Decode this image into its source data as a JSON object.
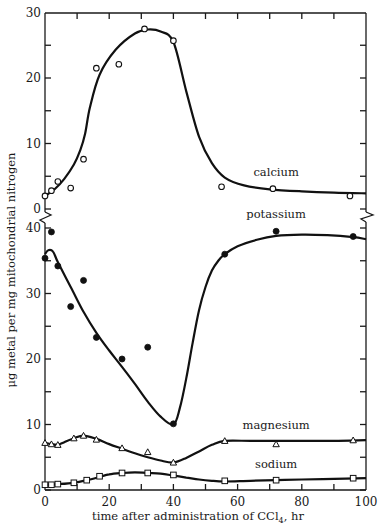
{
  "chart_data": {
    "type": "scatter",
    "title": "",
    "xlabel": "time after administration of CCl4, hr",
    "xlabel_parts": {
      "main": "time after administration of CCl",
      "subscript": "4",
      "tail": ", hr"
    },
    "ylabel": "μg metal per mg mitochondrial nitrogen",
    "xlim": [
      0,
      100
    ],
    "xticks": [
      0,
      20,
      40,
      60,
      80,
      100
    ],
    "x_minor_ticks": [
      10,
      30,
      50,
      70,
      90
    ],
    "grid": false,
    "legend": "inline labels next to curves",
    "panels": [
      {
        "name": "upper",
        "ylim": [
          0,
          30
        ],
        "yticks": [
          0,
          10,
          20,
          30
        ],
        "y_minor_ticks": [
          5,
          15,
          25
        ],
        "axis_break_below": true
      },
      {
        "name": "lower",
        "ylim": [
          0,
          42
        ],
        "yticks": [
          0,
          10,
          20,
          30,
          40
        ],
        "y_minor_ticks": [
          5,
          15,
          25,
          35
        ],
        "axis_break_above": true
      }
    ],
    "series": [
      {
        "name": "calcium",
        "panel": "upper",
        "marker": "open-circle",
        "x": [
          0,
          2,
          4,
          8,
          12,
          16,
          23,
          31,
          40,
          55,
          71,
          95
        ],
        "y": [
          2.0,
          2.8,
          4.2,
          3.2,
          7.6,
          21.5,
          22.1,
          27.5,
          25.7,
          3.4,
          3.1,
          2.0
        ],
        "curve_x": [
          0,
          3,
          6,
          9,
          11,
          12.5,
          14,
          17,
          22,
          28,
          32,
          36,
          40,
          44,
          48,
          52,
          56,
          62,
          70,
          80,
          90,
          100
        ],
        "curve_y": [
          2.0,
          3.0,
          4.6,
          6.8,
          9.0,
          11.5,
          15.5,
          20.5,
          24.3,
          26.8,
          27.4,
          27.1,
          25.5,
          18.0,
          11.0,
          7.0,
          4.8,
          3.6,
          3.0,
          2.7,
          2.5,
          2.4
        ]
      },
      {
        "name": "potassium",
        "panel": "lower",
        "marker": "filled-circle",
        "x": [
          0,
          2,
          4,
          8,
          12,
          16,
          24,
          32,
          40,
          56,
          72,
          96
        ],
        "y": [
          35.4,
          39.4,
          34.2,
          28.0,
          32.0,
          23.3,
          20.0,
          21.8,
          10.1,
          36.0,
          39.5,
          38.7
        ],
        "curve_x": [
          0,
          1,
          2.5,
          4,
          8,
          12,
          16,
          20,
          24,
          28,
          32,
          36,
          40,
          42,
          44,
          46,
          48,
          50,
          52,
          54,
          56,
          60,
          66,
          72,
          80,
          88,
          96,
          100
        ],
        "curve_y": [
          36.0,
          36.6,
          36.4,
          34.8,
          31.0,
          27.2,
          24.0,
          21.3,
          18.8,
          16.2,
          13.5,
          11.2,
          10.0,
          12.5,
          17.0,
          22.5,
          27.5,
          31.0,
          33.5,
          35.0,
          36.0,
          37.2,
          38.2,
          38.8,
          39.0,
          38.9,
          38.6,
          38.3
        ]
      },
      {
        "name": "magnesium",
        "panel": "lower",
        "marker": "open-triangle",
        "x": [
          0,
          2,
          4,
          9,
          12,
          16,
          24,
          32,
          40,
          56,
          72,
          96
        ],
        "y": [
          7.2,
          7.0,
          6.9,
          7.9,
          8.3,
          7.7,
          6.4,
          5.8,
          4.2,
          7.5,
          7.0,
          7.6
        ],
        "curve_x": [
          0,
          2,
          4,
          6,
          9,
          12,
          16,
          20,
          24,
          28,
          32,
          36,
          40,
          44,
          48,
          52,
          56,
          64,
          72,
          80,
          90,
          100
        ],
        "curve_y": [
          7.2,
          7.0,
          6.9,
          7.3,
          7.9,
          8.3,
          7.8,
          7.0,
          6.3,
          5.6,
          5.0,
          4.5,
          4.2,
          4.9,
          5.9,
          6.9,
          7.5,
          7.5,
          7.5,
          7.5,
          7.5,
          7.6
        ]
      },
      {
        "name": "sodium",
        "panel": "lower",
        "marker": "open-square",
        "x": [
          0,
          2,
          4,
          9,
          13,
          17,
          24,
          32,
          40,
          56,
          72,
          96
        ],
        "y": [
          0.8,
          0.8,
          0.9,
          1.1,
          1.5,
          2.1,
          2.6,
          2.6,
          2.3,
          1.4,
          1.5,
          1.8
        ],
        "curve_x": [
          0,
          4,
          9,
          13,
          17,
          20,
          24,
          28,
          32,
          36,
          40,
          44,
          48,
          52,
          56,
          64,
          72,
          80,
          90,
          100
        ],
        "curve_y": [
          0.8,
          0.9,
          1.1,
          1.5,
          2.0,
          2.4,
          2.6,
          2.7,
          2.6,
          2.5,
          2.2,
          1.9,
          1.6,
          1.4,
          1.3,
          1.4,
          1.5,
          1.6,
          1.7,
          1.8
        ]
      }
    ],
    "annotations": [
      {
        "text": "calcium",
        "x": 72,
        "y": 5.0,
        "panel": "upper"
      },
      {
        "text": "potassium",
        "x": 72,
        "y": 41.5,
        "panel": "lower"
      },
      {
        "text": "magnesium",
        "x": 72,
        "y": 9.3,
        "panel": "lower"
      },
      {
        "text": "sodium",
        "x": 72,
        "y": 3.4,
        "panel": "lower"
      }
    ]
  }
}
